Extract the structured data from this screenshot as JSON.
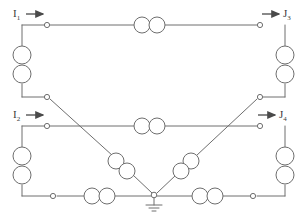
{
  "diagram": {
    "stroke_color": "#6e6e6e",
    "node_fill": "#ffffff",
    "label_color": "#3a3a3a",
    "background": "#ffffff",
    "terminals": [
      {
        "id": "t-in-top",
        "label_main": "I",
        "label_sub": "1",
        "arrow": "right"
      },
      {
        "id": "t-out-top",
        "label_main": "J",
        "label_sub": "3",
        "arrow": "right"
      },
      {
        "id": "t-in-bottom",
        "label_main": "I",
        "label_sub": "2",
        "arrow": "right"
      },
      {
        "id": "t-out-bottom",
        "label_main": "J",
        "label_sub": "4",
        "arrow": "right"
      }
    ],
    "ground": {
      "symbol": "earth-ground",
      "count": 1
    },
    "coil_pairs": [
      {
        "id": "coil-top-horizontal",
        "orientation": "horizontal",
        "circles": 2
      },
      {
        "id": "coil-top-left-vertical",
        "orientation": "vertical",
        "circles": 2
      },
      {
        "id": "coil-top-right-vertical",
        "orientation": "vertical",
        "circles": 2
      },
      {
        "id": "coil-mid-horizontal",
        "orientation": "horizontal",
        "circles": 2
      },
      {
        "id": "coil-bottom-left-vertical",
        "orientation": "vertical",
        "circles": 2
      },
      {
        "id": "coil-bottom-right-vertical",
        "orientation": "vertical",
        "circles": 2
      },
      {
        "id": "coil-bottom-left-horizontal",
        "orientation": "horizontal",
        "circles": 2
      },
      {
        "id": "coil-bottom-right-horizontal",
        "orientation": "horizontal",
        "circles": 2
      },
      {
        "id": "coil-diagonal-left",
        "orientation": "diagonal",
        "circles": 2
      },
      {
        "id": "coil-diagonal-right",
        "orientation": "diagonal",
        "circles": 2
      }
    ],
    "junction_nodes": 8
  },
  "labels": {
    "i1": "I",
    "i1_sub": "1",
    "j3": "J",
    "j3_sub": "3",
    "i2": "I",
    "i2_sub": "2",
    "j4": "J",
    "j4_sub": "4"
  }
}
